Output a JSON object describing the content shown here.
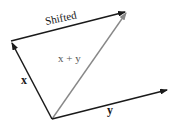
{
  "diagram": {
    "vectors": [
      {
        "id": "x",
        "label": "x",
        "from": "origin",
        "to": "x_tip",
        "color": "#1a1a1a"
      },
      {
        "id": "y",
        "label": "y",
        "from": "origin",
        "to": "y_tip",
        "color": "#1a1a1a"
      },
      {
        "id": "sum",
        "label": "x + y",
        "from": "origin",
        "to": "sum_tip",
        "color": "#888888"
      },
      {
        "id": "shifted",
        "label": "Shifted",
        "from": "x_tip",
        "to": "sum_tip",
        "color": "#1a1a1a"
      }
    ],
    "labels": {
      "x": "x",
      "y": "y",
      "sum": "x + y",
      "shifted": "Shifted"
    }
  }
}
